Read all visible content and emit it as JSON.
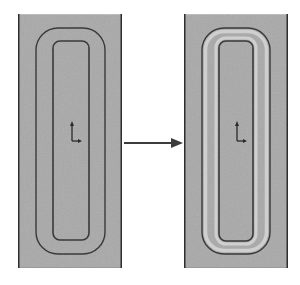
{
  "diagram": {
    "type": "before-after transformation",
    "colors": {
      "background": "#ffffff",
      "panel_fill": "#a9a9a9",
      "panel_border": "#2e2e2e",
      "loop_line": "#3a3a3a",
      "offset_highlight": "#cfcfcf",
      "arrow": "#3c3c3c",
      "axis_icon": "#2a2a2a"
    },
    "panels": [
      {
        "id": "before",
        "label": "",
        "x": 18,
        "y": 14,
        "width": 104,
        "height": 254,
        "outer_loop": {
          "x": 36,
          "y": 28,
          "width": 69,
          "height": 226,
          "radius": 22
        },
        "inner_loop": {
          "x": 53,
          "y": 41,
          "width": 36,
          "height": 199,
          "radius": 7
        },
        "offset_band_highlighted": false,
        "axis_icon": {
          "x": 71,
          "y": 121,
          "name": "coordinate-axes-icon"
        }
      },
      {
        "id": "after",
        "label": "",
        "x": 184,
        "y": 14,
        "width": 104,
        "height": 254,
        "outer_loop": {
          "x": 202,
          "y": 28,
          "width": 68,
          "height": 226,
          "radius": 22
        },
        "inner_loop": {
          "x": 219,
          "y": 41,
          "width": 34,
          "height": 200,
          "radius": 7
        },
        "offset_band_highlighted": true,
        "axis_icon": {
          "x": 236,
          "y": 121,
          "name": "coordinate-axes-icon"
        }
      }
    ],
    "arrow": {
      "from": [
        124,
        143
      ],
      "to": [
        183,
        143
      ],
      "direction": "right"
    }
  }
}
